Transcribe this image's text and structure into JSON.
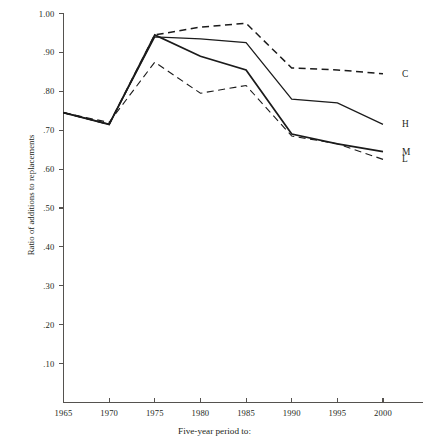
{
  "chart_data": {
    "type": "line",
    "title": "",
    "subtitle": "",
    "xlabel": "Five-year period to:",
    "ylabel": "Ratio of additions to replacements",
    "x": [
      1965,
      1970,
      1975,
      1980,
      1985,
      1990,
      1995,
      2000
    ],
    "xtick_labels": [
      "1965",
      "1970",
      "1975",
      "1980",
      "1985",
      "1990",
      "1995",
      "2000"
    ],
    "xlim": [
      1965,
      2000
    ],
    "ylim": [
      0.0,
      1.0
    ],
    "ytick_values": [
      1.0,
      0.9,
      0.8,
      0.7,
      0.6,
      0.5,
      0.4,
      0.3,
      0.2,
      0.1
    ],
    "ytick_labels": [
      "1.00",
      ".90",
      ".80",
      ".70",
      ".60",
      ".50",
      ".40",
      ".30",
      ".20",
      ".10"
    ],
    "grid": false,
    "legend_position": "right-end-of-line",
    "series": [
      {
        "name": "C",
        "label": "C",
        "style": "dashed",
        "color": "#1b1b1b",
        "values": [
          0.745,
          0.715,
          0.945,
          0.965,
          0.975,
          0.86,
          0.855,
          0.845
        ]
      },
      {
        "name": "H",
        "label": "H",
        "style": "solid-thin",
        "color": "#1b1b1b",
        "values": [
          0.745,
          0.715,
          0.94,
          0.935,
          0.925,
          0.78,
          0.77,
          0.715
        ]
      },
      {
        "name": "M",
        "label": "M",
        "style": "solid-thick",
        "color": "#1b1b1b",
        "values": [
          0.745,
          0.715,
          0.945,
          0.89,
          0.855,
          0.69,
          0.665,
          0.645
        ]
      },
      {
        "name": "L",
        "label": "L",
        "style": "dashed-thin",
        "color": "#1b1b1b",
        "values": [
          0.745,
          0.72,
          0.875,
          0.795,
          0.815,
          0.685,
          0.665,
          0.625
        ]
      }
    ]
  },
  "axis": {
    "y_title": "Ratio of additions to replacements",
    "x_title": "Five-year period to:"
  }
}
